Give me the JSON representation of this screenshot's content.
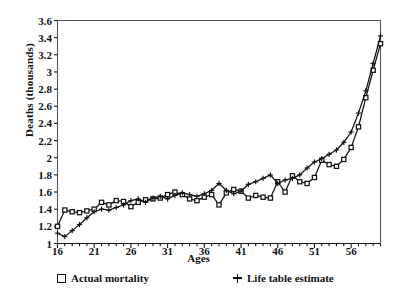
{
  "chart_data": {
    "type": "line",
    "title": "",
    "xlabel": "Ages",
    "ylabel": "Deaths  (thousands)",
    "xlim": [
      16,
      60
    ],
    "ylim": [
      1,
      3.6
    ],
    "grid": false,
    "legend_position": "bottom",
    "x_major_ticks": [
      16,
      21,
      26,
      31,
      36,
      41,
      46,
      51,
      56
    ],
    "x_minor_tick_step": 1,
    "y_ticks": [
      1,
      1.2,
      1.4,
      1.6,
      1.8,
      2,
      2.2,
      2.4,
      2.6,
      2.8,
      3,
      3.2,
      3.4,
      3.6
    ],
    "y_tick_labels": [
      "1",
      "1.2",
      "1.4",
      "1.6",
      "1.8",
      "2",
      "2.2",
      "2.4",
      "2.6",
      "2.8",
      "3",
      "3.2",
      "3.4",
      "3.6"
    ],
    "x": [
      16,
      17,
      18,
      19,
      20,
      21,
      22,
      23,
      24,
      25,
      26,
      27,
      28,
      29,
      30,
      31,
      32,
      33,
      34,
      35,
      36,
      37,
      38,
      39,
      40,
      41,
      42,
      43,
      44,
      45,
      46,
      47,
      48,
      49,
      50,
      51,
      52,
      53,
      54,
      55,
      56,
      57,
      58,
      59,
      60
    ],
    "series": [
      {
        "name": "Actual mortality",
        "marker": "square-open",
        "values": [
          1.2,
          1.39,
          1.37,
          1.36,
          1.38,
          1.4,
          1.48,
          1.45,
          1.5,
          1.49,
          1.43,
          1.48,
          1.51,
          1.52,
          1.53,
          1.57,
          1.6,
          1.57,
          1.52,
          1.5,
          1.54,
          1.57,
          1.45,
          1.59,
          1.63,
          1.61,
          1.53,
          1.56,
          1.54,
          1.53,
          1.72,
          1.6,
          1.79,
          1.72,
          1.7,
          1.77,
          1.97,
          1.92,
          1.9,
          1.98,
          2.12,
          2.36,
          2.7,
          3.02,
          3.33
        ]
      },
      {
        "name": "Life table estimate",
        "marker": "plus",
        "values": [
          1.12,
          1.08,
          1.15,
          1.22,
          1.3,
          1.37,
          1.4,
          1.39,
          1.42,
          1.45,
          1.5,
          1.52,
          1.48,
          1.53,
          1.55,
          1.52,
          1.56,
          1.59,
          1.57,
          1.55,
          1.58,
          1.62,
          1.7,
          1.62,
          1.58,
          1.61,
          1.69,
          1.72,
          1.76,
          1.8,
          1.7,
          1.74,
          1.76,
          1.8,
          1.88,
          1.95,
          1.99,
          2.04,
          2.09,
          2.18,
          2.3,
          2.52,
          2.78,
          3.1,
          3.42
        ]
      }
    ]
  },
  "legend": {
    "actual_label": "Actual mortality",
    "lifetable_label": "Life table estimate"
  }
}
